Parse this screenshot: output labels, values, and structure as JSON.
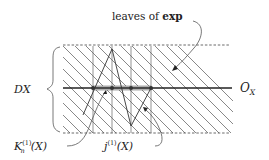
{
  "labels": {
    "leaves_prefix": "leaves of ",
    "leaves_bold": "exp",
    "dx": "DX",
    "ox_main": "O",
    "ox_sub": "X",
    "k_main": "K",
    "k_sup": "(1)",
    "k_sub": "n",
    "k_arg": "(X)",
    "j_main": "j",
    "j_sup": "(1)",
    "j_arg": "(X)"
  },
  "colors": {
    "line": "#222222",
    "hatch": "#555555",
    "shade": "#cccccc",
    "dashed": "#444444"
  }
}
